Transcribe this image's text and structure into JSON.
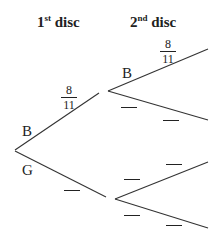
{
  "headers": {
    "first": {
      "num": "1",
      "sup": "st",
      "text": " disc"
    },
    "second": {
      "num": "2",
      "sup": "nd",
      "text": " disc"
    }
  },
  "first_stage": {
    "upper": {
      "label": "B",
      "probability": {
        "numerator": "8",
        "denominator": "11"
      }
    },
    "lower": {
      "label": "G",
      "probability": "blank"
    }
  },
  "second_stage": {
    "after_B": {
      "upper": {
        "label": "B",
        "probability": {
          "numerator": "8",
          "denominator": "11"
        }
      },
      "lower": {
        "label": "",
        "probability": "blank"
      }
    },
    "after_G": {
      "upper": {
        "probability": "blank"
      },
      "lower": {
        "probability": "blank"
      }
    }
  },
  "line_color": "#333333"
}
